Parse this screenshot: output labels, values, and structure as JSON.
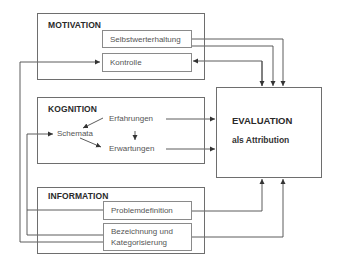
{
  "motivation": {
    "title": "MOTIVATION",
    "items": [
      "Selbstwerterhaltung",
      "Kontrolle"
    ]
  },
  "kognition": {
    "title": "KOGNITION",
    "items": {
      "erfahrungen": "Erfahrungen",
      "schemata": "Schemata",
      "erwartungen": "Erwartungen"
    }
  },
  "evaluation": {
    "title": "EVALUATION",
    "subtitle": "als Attribution"
  },
  "information": {
    "title": "INFORMATION",
    "items": [
      "Problemdefinition",
      "Bezeichnung und",
      "Kategorisierung"
    ]
  },
  "colors": {
    "line": "#4a4a4a",
    "box_border": "#6e6e6e",
    "background": "#ffffff"
  }
}
